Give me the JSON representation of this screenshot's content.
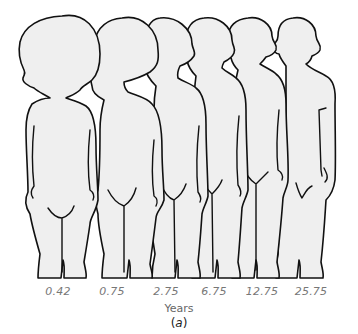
{
  "figure": {
    "type": "body-proportion-illustration",
    "figures": [
      {
        "age": "0.42",
        "label": "0.42"
      },
      {
        "age": "0.75",
        "label": "0.75"
      },
      {
        "age": "2.75",
        "label": "2.75"
      },
      {
        "age": "6.75",
        "label": "6.75"
      },
      {
        "age": "12.75",
        "label": "12.75"
      },
      {
        "age": "25.75",
        "label": "25.75"
      }
    ],
    "axis_label": "Years",
    "panel_label_open": "(",
    "panel_label_letter": "a",
    "panel_label_close": ")",
    "colors": {
      "fill": "#efefef",
      "outline": "#111111",
      "label_text": "#777777"
    }
  }
}
